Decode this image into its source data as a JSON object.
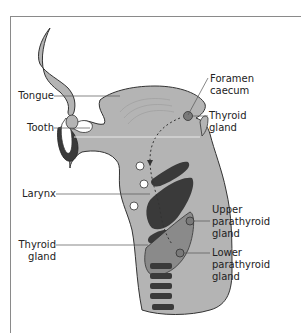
{
  "diagram": {
    "title": "",
    "colors": {
      "background": "#ffffff",
      "frame": "#8a8a8a",
      "tissue_light": "#b4b4b4",
      "tissue_dark": "#3a3a3a",
      "thyroid": "#8a8a8a",
      "gland_dot": "#7a7a7a",
      "tooth": "#ffffff",
      "leader_line": "#555555",
      "label_text": "#222222"
    },
    "labels": {
      "tongue": "Tongue",
      "tooth": "Tooth",
      "larynx": "Larynx",
      "thyroid_gland_left_line1": "Thyroid",
      "thyroid_gland_left_line2": "gland",
      "foramen_caecum_line1": "Foramen",
      "foramen_caecum_line2": "caecum",
      "thyroid_gland_right_line1": "Thyroid",
      "thyroid_gland_right_line2": "gland",
      "upper_parathyroid_line1": "Upper",
      "upper_parathyroid_line2": "parathyroid",
      "upper_parathyroid_line3": "gland",
      "lower_parathyroid_line1": "Lower",
      "lower_parathyroid_line2": "parathyroid",
      "lower_parathyroid_line3": "gland"
    },
    "icons": {
      "descent_path": "dashed-arrow-down",
      "migration_stage_markers": "open-circle"
    }
  }
}
